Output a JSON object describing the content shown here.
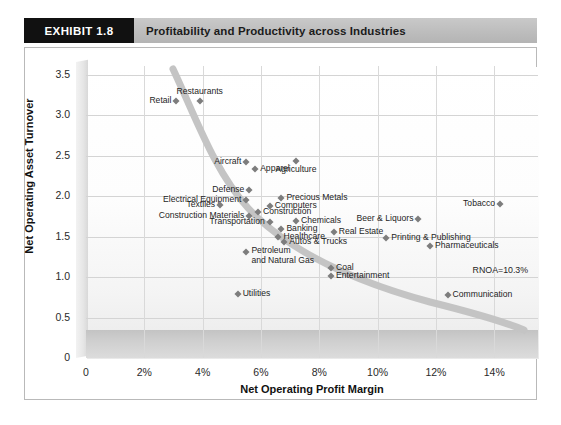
{
  "header": {
    "exhibit_badge": "EXHIBIT 1.8",
    "title": "Profitability and Productivity across Industries"
  },
  "chart_data": {
    "type": "scatter",
    "title": "Profitability and Productivity across Industries",
    "xlabel": "Net Operating Profit Margin",
    "ylabel": "Net Operating Asset Turnover",
    "xlim": [
      0,
      15.5
    ],
    "ylim": [
      0,
      3.75
    ],
    "xticks": [
      "0",
      "2%",
      "4%",
      "6%",
      "8%",
      "10%",
      "12%",
      "14%"
    ],
    "xtick_values": [
      0,
      2,
      4,
      6,
      8,
      10,
      12,
      14
    ],
    "yticks": [
      "0",
      "0.5",
      "1.0",
      "1.5",
      "2.0",
      "2.5",
      "3.0",
      "3.5"
    ],
    "ytick_values": [
      0,
      0.5,
      1.0,
      1.5,
      2.0,
      2.5,
      3.0,
      3.5
    ],
    "grid": true,
    "legend": "none",
    "marker_color": "#7d7d7d",
    "curve_color": "#c2c2c2",
    "annotations": [
      {
        "text": "RNOA=10.3%",
        "x": 13.6,
        "y": 1.07
      }
    ],
    "points": [
      {
        "label": "Retail",
        "x": 3.1,
        "y": 3.18,
        "pos": "left"
      },
      {
        "label": "Restaurants",
        "x": 3.9,
        "y": 3.18,
        "pos": "above"
      },
      {
        "label": "Aircraft",
        "x": 5.5,
        "y": 2.42,
        "pos": "left"
      },
      {
        "label": "Apparel",
        "x": 5.8,
        "y": 2.34,
        "pos": "right"
      },
      {
        "label": "Agriculture",
        "x": 7.2,
        "y": 2.44,
        "pos": "below"
      },
      {
        "label": "Defense",
        "x": 5.6,
        "y": 2.08,
        "pos": "left"
      },
      {
        "label": "Electrical Equipment",
        "x": 5.5,
        "y": 1.95,
        "pos": "left"
      },
      {
        "label": "Precious Metals",
        "x": 6.7,
        "y": 1.98,
        "pos": "right"
      },
      {
        "label": "Textiles",
        "x": 4.6,
        "y": 1.89,
        "pos": "left"
      },
      {
        "label": "Computers",
        "x": 6.3,
        "y": 1.88,
        "pos": "right"
      },
      {
        "label": "Construction",
        "x": 5.9,
        "y": 1.8,
        "pos": "right"
      },
      {
        "label": "Construction Materials",
        "x": 5.6,
        "y": 1.76,
        "pos": "left"
      },
      {
        "label": "Transportation",
        "x": 6.3,
        "y": 1.68,
        "pos": "left"
      },
      {
        "label": "Chemicals",
        "x": 7.2,
        "y": 1.7,
        "pos": "right"
      },
      {
        "label": "Banking",
        "x": 6.7,
        "y": 1.59,
        "pos": "right"
      },
      {
        "label": "Real Estate",
        "x": 8.5,
        "y": 1.56,
        "pos": "right"
      },
      {
        "label": "Healthcare",
        "x": 6.6,
        "y": 1.5,
        "pos": "right"
      },
      {
        "label": "Beer & Liquors",
        "x": 11.4,
        "y": 1.72,
        "pos": "left"
      },
      {
        "label": "Printing & Publishing",
        "x": 10.3,
        "y": 1.49,
        "pos": "right"
      },
      {
        "label": "Autos & Trucks",
        "x": 6.8,
        "y": 1.43,
        "pos": "right"
      },
      {
        "label": "Pharmaceuticals",
        "x": 11.8,
        "y": 1.38,
        "pos": "right"
      },
      {
        "label": "Tobacco",
        "x": 14.2,
        "y": 1.9,
        "pos": "left"
      },
      {
        "label": "Petroleum\nand Natural Gas",
        "x": 5.5,
        "y": 1.31,
        "pos": "right-multiline"
      },
      {
        "label": "Coal",
        "x": 8.4,
        "y": 1.11,
        "pos": "right"
      },
      {
        "label": "Entertainment",
        "x": 8.4,
        "y": 1.01,
        "pos": "right"
      },
      {
        "label": "Utilities",
        "x": 5.2,
        "y": 0.79,
        "pos": "right"
      },
      {
        "label": "Communication",
        "x": 12.4,
        "y": 0.78,
        "pos": "right"
      }
    ]
  }
}
